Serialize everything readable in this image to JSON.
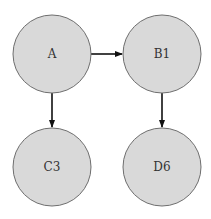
{
  "diagram": {
    "type": "directed-graph",
    "colors": {
      "node_fill": "#d9d9d9",
      "node_stroke": "#6e6e6e",
      "edge": "#111111",
      "label": "#333333"
    },
    "nodes": [
      {
        "id": "A",
        "label": "A",
        "cx": 52,
        "cy": 54,
        "r": 39
      },
      {
        "id": "B1",
        "label": "B1",
        "cx": 162,
        "cy": 54,
        "r": 39
      },
      {
        "id": "C3",
        "label": "C3",
        "cx": 52,
        "cy": 167,
        "r": 39
      },
      {
        "id": "D6",
        "label": "D6",
        "cx": 162,
        "cy": 167,
        "r": 39
      }
    ],
    "edges": [
      {
        "from": "A",
        "to": "B1"
      },
      {
        "from": "A",
        "to": "C3"
      },
      {
        "from": "B1",
        "to": "D6"
      }
    ]
  }
}
